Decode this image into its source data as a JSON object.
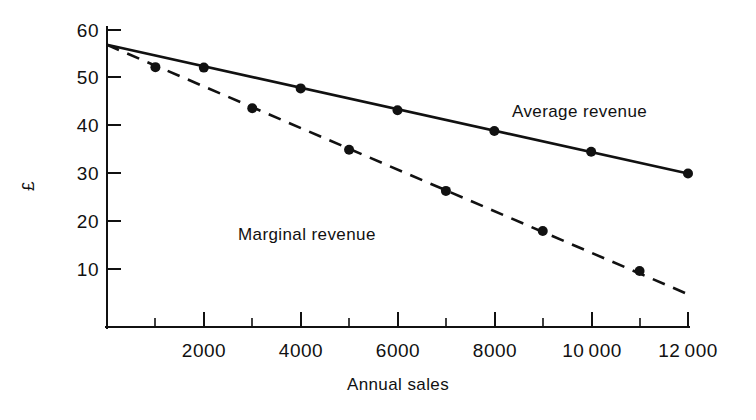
{
  "chart_data": {
    "type": "line",
    "title": "",
    "subtitle": "",
    "xlabel": "Annual sales",
    "ylabel": "£",
    "xlim": [
      0,
      12000
    ],
    "ylim": [
      0,
      60
    ],
    "grid": false,
    "legend_position": "inline-annotation",
    "x_ticks_major": [
      "2000",
      "4000",
      "6000",
      "8000",
      "10 000",
      "12 000"
    ],
    "x_tick_major_values": [
      2000,
      4000,
      6000,
      8000,
      10000,
      12000
    ],
    "x_tick_minor_values": [
      1000,
      3000,
      5000,
      7000,
      9000,
      11000
    ],
    "y_ticks": [
      "10",
      "20",
      "30",
      "40",
      "50",
      "60"
    ],
    "y_tick_values": [
      10,
      20,
      30,
      40,
      50,
      60
    ],
    "series": [
      {
        "name": "Average revenue",
        "style": "solid",
        "label": "Average revenue",
        "x": [
          2000,
          4000,
          6000,
          8000,
          10000,
          12000
        ],
        "values": [
          52.4,
          48.2,
          43.8,
          39.6,
          35.4,
          31.0
        ],
        "line_from": {
          "x": 0,
          "y": 57.0
        },
        "line_to": {
          "x": 12000,
          "y": 31.0
        }
      },
      {
        "name": "Marginal revenue",
        "style": "dashed",
        "label": "Marginal revenue",
        "x": [
          1000,
          3000,
          5000,
          7000,
          9000,
          11000
        ],
        "values": [
          52.5,
          44.2,
          35.8,
          27.5,
          19.4,
          11.3
        ],
        "line_from": {
          "x": 0,
          "y": 57.0
        },
        "line_to": {
          "x": 12100,
          "y": 6.2
        }
      }
    ],
    "colors": {
      "line": "#111111",
      "marker": "#111111",
      "axis": "#111111",
      "background": "#ffffff"
    }
  }
}
